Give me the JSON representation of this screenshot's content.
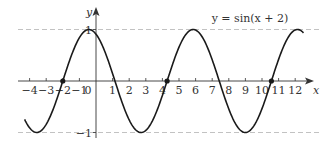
{
  "chart_data": {
    "type": "line",
    "title": "",
    "function_label": "y = sin(x + 2)",
    "xlabel": "x",
    "ylabel": "y",
    "origin_label": "0",
    "x_ticks": [
      -4,
      -3,
      -2,
      -1,
      1,
      2,
      3,
      4,
      5,
      6,
      7,
      8,
      9,
      10,
      11,
      12
    ],
    "x_tick_labels": [
      "−4",
      "−3",
      "−2",
      "−1",
      "1",
      "2",
      "3",
      "4",
      "5",
      "6",
      "7",
      "8",
      "9",
      "10",
      "11",
      "12"
    ],
    "y_ticks": [
      1,
      -1
    ],
    "y_tick_labels": [
      "1",
      "−1"
    ],
    "xlim": [
      -4.3,
      12.5
    ],
    "ylim": [
      -1,
      1
    ],
    "grid": false,
    "reference_lines": [
      {
        "y": 1,
        "style": "dashed"
      },
      {
        "y": -1,
        "style": "dashed"
      }
    ],
    "series": [
      {
        "name": "y = sin(x + 2)",
        "expression": "sin(x + 2)",
        "x_range": [
          -4.3,
          12.5
        ],
        "sample_points": [
          {
            "x": -4,
            "y": -0.909
          },
          {
            "x": -3,
            "y": -0.841
          },
          {
            "x": -2,
            "y": 0
          },
          {
            "x": -1,
            "y": 0.841
          },
          {
            "x": 0,
            "y": 0.909
          },
          {
            "x": 1,
            "y": 0.141
          },
          {
            "x": 2,
            "y": -0.757
          },
          {
            "x": 3,
            "y": -0.959
          },
          {
            "x": 4,
            "y": -0.279
          },
          {
            "x": 5,
            "y": 0.657
          },
          {
            "x": 6,
            "y": 0.989
          },
          {
            "x": 7,
            "y": 0.412
          },
          {
            "x": 8,
            "y": -0.544
          },
          {
            "x": 9,
            "y": -1.0
          },
          {
            "x": 10,
            "y": -0.537
          },
          {
            "x": 11,
            "y": 0.42
          },
          {
            "x": 12,
            "y": 0.991
          }
        ]
      }
    ],
    "marked_points": [
      {
        "x": -2,
        "y": 0
      },
      {
        "x": 4.283,
        "y": 0
      },
      {
        "x": 10.566,
        "y": 0
      }
    ]
  },
  "colors": {
    "curve": "#1a1a1a",
    "axis": "#333333",
    "dashed": "#bbbbbb",
    "text": "#333333"
  }
}
